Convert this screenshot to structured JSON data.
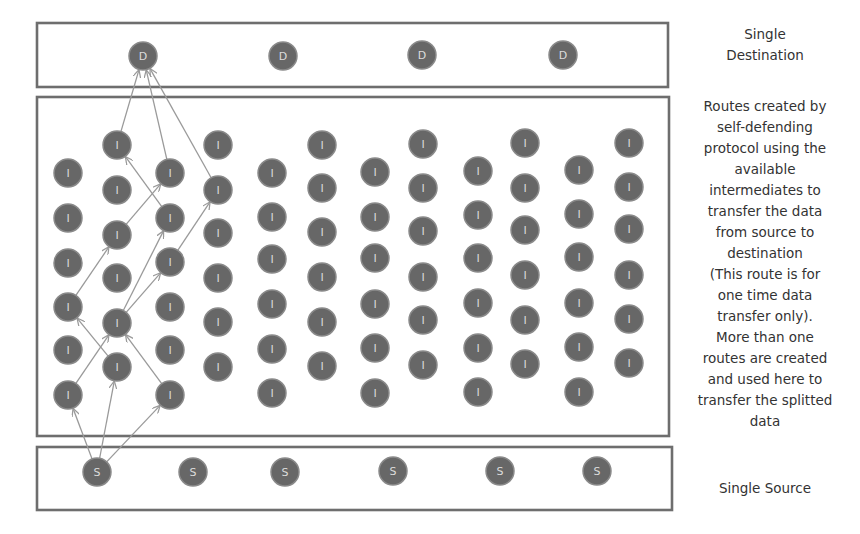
{
  "labels": {
    "destination": "Single\nDestination",
    "routes_description": "Routes created by\nself-defending\nprotocol using the\navailable\nintermediates to\ntransfer the data\nfrom source to\ndestination\n(This route is for\none time data\ntransfer only).\nMore than one\nroutes are created\nand used here to\ntransfer the splitted\ndata",
    "source": "Single Source"
  },
  "colors": {
    "node_fill": "#676767",
    "node_stroke": "#8a8a8a",
    "node_text": "#dcdcdc",
    "box_border": "#6e6e6e",
    "edge": "#9a9a9a",
    "label_text": "#333333"
  },
  "node_radius": 14,
  "boxes": {
    "destination": {
      "x": 37,
      "y": 23,
      "w": 631,
      "h": 64
    },
    "intermediate": {
      "x": 37,
      "y": 97,
      "w": 632,
      "h": 339
    },
    "source": {
      "x": 37,
      "y": 447,
      "w": 635,
      "h": 63
    }
  },
  "destination_nodes": [
    {
      "id": "D1",
      "label": "D",
      "x": 143,
      "y": 56
    },
    {
      "id": "D2",
      "label": "D",
      "x": 283,
      "y": 56
    },
    {
      "id": "D3",
      "label": "D",
      "x": 422,
      "y": 55
    },
    {
      "id": "D4",
      "label": "D",
      "x": 563,
      "y": 55
    }
  ],
  "intermediate_columns": [
    {
      "x": 68,
      "label": "I",
      "ys": [
        173,
        218,
        263,
        307,
        350,
        395
      ]
    },
    {
      "x": 117,
      "label": "I",
      "ys": [
        145,
        190,
        235,
        278,
        323,
        367
      ]
    },
    {
      "x": 170,
      "label": "I",
      "ys": [
        173,
        218,
        262,
        307,
        350,
        395
      ]
    },
    {
      "x": 218,
      "label": "I",
      "ys": [
        145,
        190,
        233,
        278,
        322,
        367
      ]
    },
    {
      "x": 272,
      "label": "I",
      "ys": [
        173,
        217,
        259,
        304,
        349,
        393
      ]
    },
    {
      "x": 322,
      "label": "I",
      "ys": [
        145,
        188,
        232,
        277,
        322,
        366
      ]
    },
    {
      "x": 375,
      "label": "I",
      "ys": [
        172,
        217,
        258,
        304,
        348,
        393
      ]
    },
    {
      "x": 423,
      "label": "I",
      "ys": [
        144,
        188,
        231,
        277,
        320,
        365
      ]
    },
    {
      "x": 478,
      "label": "I",
      "ys": [
        171,
        215,
        258,
        303,
        348,
        392
      ]
    },
    {
      "x": 525,
      "label": "I",
      "ys": [
        143,
        188,
        230,
        275,
        320,
        364
      ]
    },
    {
      "x": 579,
      "label": "I",
      "ys": [
        170,
        214,
        257,
        303,
        347,
        392
      ]
    },
    {
      "x": 629,
      "label": "I",
      "ys": [
        143,
        187,
        229,
        275,
        319,
        363
      ]
    }
  ],
  "source_nodes": [
    {
      "id": "S1",
      "label": "S",
      "x": 97,
      "y": 472
    },
    {
      "id": "S2",
      "label": "S",
      "x": 193,
      "y": 472
    },
    {
      "id": "S3",
      "label": "S",
      "x": 285,
      "y": 472
    },
    {
      "id": "S4",
      "label": "S",
      "x": 393,
      "y": 471
    },
    {
      "id": "S5",
      "label": "S",
      "x": 500,
      "y": 471
    },
    {
      "id": "S6",
      "label": "S",
      "x": 597,
      "y": 471
    }
  ],
  "routes": [
    {
      "from": [
        97,
        472
      ],
      "to": [
        68,
        395
      ]
    },
    {
      "from": [
        97,
        472
      ],
      "to": [
        117,
        367
      ]
    },
    {
      "from": [
        97,
        472
      ],
      "to": [
        170,
        395
      ]
    },
    {
      "from": [
        68,
        395
      ],
      "to": [
        117,
        323
      ]
    },
    {
      "from": [
        117,
        367
      ],
      "to": [
        68,
        307
      ]
    },
    {
      "from": [
        170,
        395
      ],
      "to": [
        117,
        323
      ]
    },
    {
      "from": [
        68,
        307
      ],
      "to": [
        117,
        235
      ]
    },
    {
      "from": [
        117,
        323
      ],
      "to": [
        170,
        218
      ]
    },
    {
      "from": [
        117,
        323
      ],
      "to": [
        170,
        262
      ]
    },
    {
      "from": [
        117,
        235
      ],
      "to": [
        170,
        173
      ]
    },
    {
      "from": [
        170,
        262
      ],
      "to": [
        218,
        190
      ]
    },
    {
      "from": [
        170,
        218
      ],
      "to": [
        117,
        145
      ]
    },
    {
      "from": [
        117,
        145
      ],
      "to": [
        143,
        56
      ]
    },
    {
      "from": [
        170,
        173
      ],
      "to": [
        143,
        56
      ]
    },
    {
      "from": [
        218,
        190
      ],
      "to": [
        143,
        56
      ]
    }
  ]
}
